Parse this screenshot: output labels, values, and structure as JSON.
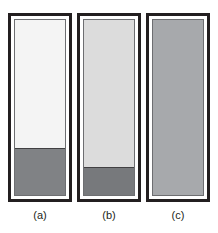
{
  "figure": {
    "background_color": "#ffffff",
    "width": 218,
    "height": 233,
    "frame_color": "#231f20",
    "inner_border_color": "#6d6e71",
    "gap_color": "#ffffff",
    "fill_boundary_color": "#414042"
  },
  "chart_data": {
    "type": "bar",
    "title": "",
    "subtitle": "",
    "xlabel": "",
    "ylabel": "",
    "grid": false,
    "legend_position": "none",
    "orientation": "vertical",
    "categories": [
      "(a)",
      "(b)",
      "(c)"
    ],
    "values": [
      27,
      16,
      0
    ],
    "ylim": [
      0,
      100
    ],
    "series": [
      {
        "name": "dark fill level (% of column height)",
        "values": [
          27,
          16,
          0
        ],
        "color": "#808285"
      },
      {
        "name": "upper medium shade (% of column height)",
        "values": [
          73,
          84,
          100
        ],
        "color": "#f1f1f1"
      }
    ],
    "panel_fill_shades": [
      "#f4f4f4",
      "#dcdcdc",
      "#a7a9ac"
    ],
    "panel_lower_shades": [
      "#808285",
      "#77797c",
      "#a7a9ac"
    ]
  },
  "panels": [
    {
      "id": "panel-a",
      "label": "(a)",
      "upper_color": "#f4f4f4",
      "lower_color": "#808285",
      "lower_fraction": 27,
      "x": 8,
      "y": 13,
      "width": 64,
      "height": 189,
      "label_x": 8,
      "label_y": 209,
      "label_width": 64
    },
    {
      "id": "panel-b",
      "label": "(b)",
      "upper_color": "#dcdcdc",
      "lower_color": "#77797c",
      "lower_fraction": 16,
      "x": 77,
      "y": 13,
      "width": 64,
      "height": 189,
      "label_x": 77,
      "label_y": 209,
      "label_width": 64
    },
    {
      "id": "panel-c",
      "label": "(c)",
      "upper_color": "#a7a9ac",
      "lower_color": "#a7a9ac",
      "lower_fraction": 0,
      "x": 146,
      "y": 13,
      "width": 64,
      "height": 189,
      "label_x": 146,
      "label_y": 209,
      "label_width": 64
    }
  ]
}
